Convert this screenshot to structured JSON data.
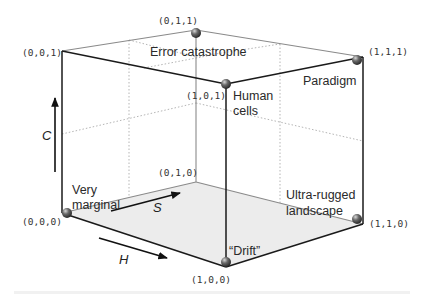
{
  "diagram": {
    "type": "cube",
    "axes": {
      "h": "H",
      "s": "S",
      "c": "C"
    },
    "vertices": [
      {
        "coord": "(0,0,0)",
        "label_lines": [
          "Very",
          "marginal"
        ]
      },
      {
        "coord": "(1,0,0)",
        "label_lines": [
          "“Drift”"
        ]
      },
      {
        "coord": "(0,1,0)",
        "label_lines": []
      },
      {
        "coord": "(1,1,0)",
        "label_lines": [
          "Ultra-rugged",
          "landscape"
        ]
      },
      {
        "coord": "(0,0,1)",
        "label_lines": []
      },
      {
        "coord": "(1,0,1)",
        "label_lines": [
          "Human",
          "cells"
        ]
      },
      {
        "coord": "(0,1,1)",
        "label_lines": [
          "Error catastrophe"
        ]
      },
      {
        "coord": "(1,1,1)",
        "label_lines": [
          "Paradigm"
        ]
      }
    ],
    "colors": {
      "edge_front": "#1a1a1a",
      "edge_back": "#8a8a8a",
      "floor": "#ececec",
      "grid_dotted": "#b0b0b0",
      "sphere": "#555555"
    }
  }
}
